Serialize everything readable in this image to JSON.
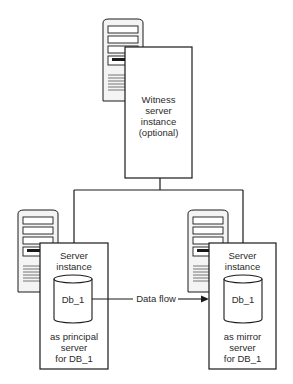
{
  "witness": {
    "line1": "Witness",
    "line2": "server",
    "line3": "instance",
    "line4": "(optional)"
  },
  "principal": {
    "title1": "Server",
    "title2": "instance",
    "db": "Db_1",
    "role1": "as principal",
    "role2": "server",
    "role3": "for DB_1"
  },
  "mirror": {
    "title1": "Server",
    "title2": "instance",
    "db": "Db_1",
    "role1": "as mirror",
    "role2": "server",
    "role3": "for DB_1"
  },
  "flow": {
    "label": "Data flow"
  },
  "colors": {
    "stroke": "#1a1a1a",
    "tower": "#f2f2f2"
  }
}
